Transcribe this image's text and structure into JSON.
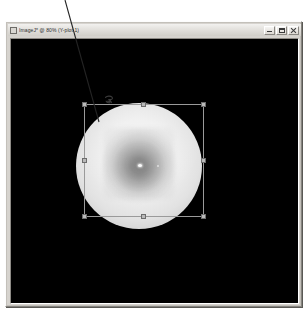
{
  "window": {
    "title": "ImageJ* @ 80% (Y-plot 1)",
    "app_icon": "imagej-icon",
    "controls": {
      "minimize_label": "Minimize",
      "maximize_label": "Maximize",
      "close_label": "Close"
    }
  },
  "canvas": {
    "background_color": "#000000",
    "specimen": {
      "name": "bright circular specimen disk",
      "center_x": 128,
      "center_y": 127,
      "radius": 63
    },
    "defect_marker": {
      "name": "dark defect mark",
      "x": 99,
      "y": 125
    }
  },
  "selection": {
    "type": "rectangle",
    "x": 78,
    "y": 86,
    "width": 120,
    "height": 113,
    "handle_count": 8,
    "stroke_color": "#9a9a9a"
  },
  "annotation": {
    "leader_line": {
      "name": "callout leader line",
      "x1": 65,
      "y1": 0,
      "x2": 99,
      "y2": 122,
      "color": "#242424"
    }
  }
}
